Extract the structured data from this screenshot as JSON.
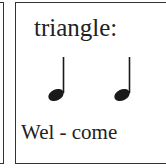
{
  "card": {
    "instrument_label": "triangle:",
    "notes": [
      {
        "type": "quarter-note",
        "icon": "quarter-note-icon"
      },
      {
        "type": "quarter-note",
        "icon": "quarter-note-icon"
      }
    ],
    "lyrics": "Wel - come"
  },
  "colors": {
    "ink": "#1a1a1a",
    "border": "#333333",
    "background": "#ffffff"
  }
}
